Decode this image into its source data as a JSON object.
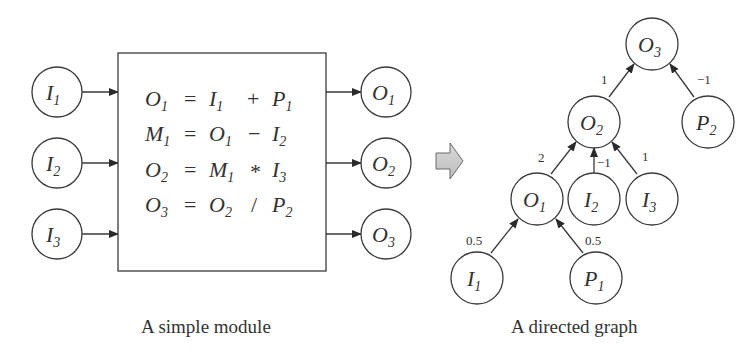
{
  "module": {
    "caption": "A simple module",
    "inputs": [
      {
        "base": "I",
        "sub": "1"
      },
      {
        "base": "I",
        "sub": "2"
      },
      {
        "base": "I",
        "sub": "3"
      }
    ],
    "outputs": [
      {
        "base": "O",
        "sub": "1"
      },
      {
        "base": "O",
        "sub": "2"
      },
      {
        "base": "O",
        "sub": "3"
      }
    ],
    "equations": [
      {
        "lhs": {
          "base": "O",
          "sub": "1"
        },
        "eq": "=",
        "a": {
          "base": "I",
          "sub": "1"
        },
        "op": "+",
        "b": {
          "base": "P",
          "sub": "1"
        }
      },
      {
        "lhs": {
          "base": "M",
          "sub": "1"
        },
        "eq": "=",
        "a": {
          "base": "O",
          "sub": "1"
        },
        "op": "−",
        "b": {
          "base": "I",
          "sub": "2"
        }
      },
      {
        "lhs": {
          "base": "O",
          "sub": "2"
        },
        "eq": "=",
        "a": {
          "base": "M",
          "sub": "1"
        },
        "op": "*",
        "b": {
          "base": "I",
          "sub": "3"
        }
      },
      {
        "lhs": {
          "base": "O",
          "sub": "3"
        },
        "eq": "=",
        "a": {
          "base": "O",
          "sub": "2"
        },
        "op": "/",
        "b": {
          "base": "P",
          "sub": "2"
        }
      }
    ]
  },
  "transform_arrow": {
    "color": "#c8c8c8"
  },
  "graph": {
    "caption": "A directed graph",
    "nodes": {
      "O3": {
        "base": "O",
        "sub": "3"
      },
      "O2": {
        "base": "O",
        "sub": "2"
      },
      "P2": {
        "base": "P",
        "sub": "2"
      },
      "O1": {
        "base": "O",
        "sub": "1"
      },
      "I2": {
        "base": "I",
        "sub": "2"
      },
      "I3": {
        "base": "I",
        "sub": "3"
      },
      "I1": {
        "base": "I",
        "sub": "1"
      },
      "P1": {
        "base": "P",
        "sub": "1"
      }
    },
    "edges": [
      {
        "from": "O2",
        "to": "O3",
        "weight": "1"
      },
      {
        "from": "P2",
        "to": "O3",
        "weight": "−1"
      },
      {
        "from": "O1",
        "to": "O2",
        "weight": "2"
      },
      {
        "from": "I2",
        "to": "O2",
        "weight": "−1"
      },
      {
        "from": "I3",
        "to": "O2",
        "weight": "1"
      },
      {
        "from": "I1",
        "to": "O1",
        "weight": "0.5"
      },
      {
        "from": "P1",
        "to": "O1",
        "weight": "0.5"
      }
    ]
  }
}
